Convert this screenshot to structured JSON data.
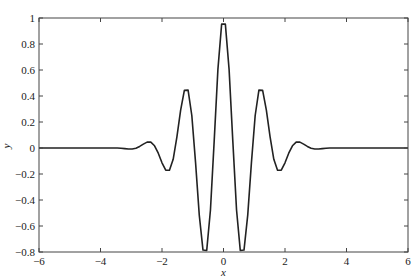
{
  "chart_data": {
    "type": "line",
    "title": "",
    "xlabel": "x",
    "ylabel": "y",
    "xlim": [
      -6,
      6
    ],
    "ylim": [
      -0.8,
      1
    ],
    "xticks": [
      -6,
      -4,
      -2,
      0,
      2,
      4,
      6
    ],
    "xtick_labels": [
      "−6",
      "−4",
      "−2",
      "0",
      "2",
      "4",
      "6"
    ],
    "yticks": [
      -0.8,
      -0.6,
      -0.4,
      -0.2,
      0,
      0.2,
      0.4,
      0.6,
      0.8,
      1
    ],
    "ytick_labels": [
      "−0.8",
      "−0.6",
      "−0.4",
      "−0.2",
      "0",
      "0.2",
      "0.4",
      "0.6",
      "0.8",
      "1"
    ],
    "grid": false,
    "legend": null,
    "line_color": "#222222",
    "series": [
      {
        "name": "y",
        "x_start": -6,
        "x_end": 6,
        "num_points": 100,
        "y_half": [
          0,
          0,
          0,
          0,
          0,
          0,
          0,
          0,
          0,
          0,
          0,
          0,
          0,
          0,
          0,
          0,
          0,
          0,
          0,
          0,
          0,
          0,
          -0.002,
          -0.005,
          -0.008,
          -0.008,
          -0.002,
          0.012,
          0.03,
          0.045,
          0.045,
          0.017,
          -0.04,
          -0.114,
          -0.171,
          -0.171,
          -0.087,
          0.085,
          0.292,
          0.443,
          0.445,
          0.25,
          -0.111,
          -0.516,
          -0.785,
          -0.788,
          -0.477,
          0.053,
          0.605,
          0.953
        ]
      }
    ]
  }
}
